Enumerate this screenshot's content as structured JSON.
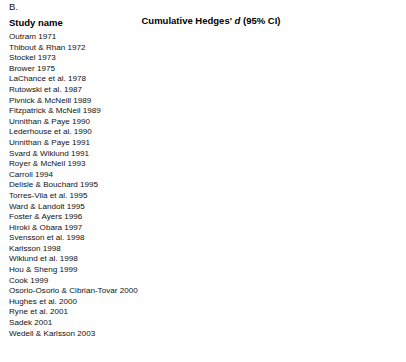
{
  "panel": {
    "label": "B."
  },
  "headers": {
    "study_name": "Study name",
    "effect_prefix": "Cumulative Hedges' ",
    "effect_italic": "d",
    "effect_suffix": " (95% CI)"
  },
  "axis": {
    "ticks": [
      "−1.00",
      "−0.50",
      "0.00",
      "0.50",
      "1.00"
    ],
    "tick_values": [
      -1.0,
      -0.5,
      0.0,
      0.5,
      1.0
    ],
    "min": -1.0,
    "max": 1.0,
    "reference_line": 0.0,
    "gridlines": [
      -1.0,
      0.0,
      1.0
    ]
  },
  "colors": {
    "marker": "#1a1a1a",
    "line": "#333333",
    "gridline": "#888888",
    "reference": "#999999",
    "text": "#111111",
    "background": "#ffffff"
  },
  "chart_data": {
    "type": "forest",
    "title": "Cumulative Hedges' d (95% CI)",
    "xlabel": "",
    "ylabel": "Study name",
    "xlim": [
      -1.0,
      1.0
    ],
    "grid": true,
    "legend": "none",
    "categories": [
      "Outram 1971",
      "Thibout & Rhan 1972",
      "Stockel 1973",
      "Brower 1975",
      "LaChance et al. 1978",
      "Rutowski et al. 1987",
      "Pivnick & McNeill 1989",
      "Fitzpatrick & McNeil 1989",
      "Unnithan & Paye 1990",
      "Lederhouse et al. 1990",
      "Unnithan & Paye 1991",
      "Svard & Wiklund 1991",
      "Royer & McNeil 1993",
      "Carroll 1994",
      "Delisle & Bouchard 1995",
      "Torres-Vila et al. 1995",
      "Ward & Landolt 1995",
      "Foster & Ayers 1996",
      "Hiroki & Obara 1997",
      "Svensson et al. 1998",
      "Karlsson 1998",
      "Wiklund et al. 1998",
      "Hou & Sheng 1999",
      "Cook 1999",
      "Osorio-Osorio & Cibrian-Tovar 2000",
      "Hughes et al. 2000",
      "Ryne et al. 2001",
      "Sadek 2001",
      "Wedell & Karlsson 2003"
    ],
    "points": [
      {
        "study": "Outram 1971",
        "estimate": 0.19,
        "ci_low": -0.45,
        "ci_high": 0.65
      },
      {
        "study": "Thibout & Rhan 1972",
        "estimate": 0.37,
        "ci_low": -0.26,
        "ci_high": 0.98
      },
      {
        "study": "Stockel 1973",
        "estimate": 0.45,
        "ci_low": -0.02,
        "ci_high": 0.88
      },
      {
        "study": "Brower 1975",
        "estimate": 0.38,
        "ci_low": -0.09,
        "ci_high": 0.79
      },
      {
        "study": "LaChance et al. 1978",
        "estimate": 0.48,
        "ci_low": 0.04,
        "ci_high": 0.88
      },
      {
        "study": "Rutowski et al. 1987",
        "estimate": 0.42,
        "ci_low": 0.0,
        "ci_high": 0.81
      },
      {
        "study": "Pivnick & McNeill 1989",
        "estimate": 0.5,
        "ci_low": 0.1,
        "ci_high": 0.88
      },
      {
        "study": "Fitzpatrick & McNeil 1989",
        "estimate": 0.42,
        "ci_low": 0.04,
        "ci_high": 0.78
      },
      {
        "study": "Unnithan & Paye 1990",
        "estimate": 0.28,
        "ci_low": -0.14,
        "ci_high": 0.67
      },
      {
        "study": "Lederhouse et al. 1990",
        "estimate": 0.3,
        "ci_low": -0.08,
        "ci_high": 0.64
      },
      {
        "study": "Unnithan & Paye 1991",
        "estimate": 0.3,
        "ci_low": -0.1,
        "ci_high": 0.62
      },
      {
        "study": "Svard & Wiklund 1991",
        "estimate": 0.22,
        "ci_low": -0.18,
        "ci_high": 0.58
      },
      {
        "study": "Royer & McNeil 1993",
        "estimate": 0.2,
        "ci_low": -0.16,
        "ci_high": 0.54
      },
      {
        "study": "Carroll 1994",
        "estimate": 0.22,
        "ci_low": -0.13,
        "ci_high": 0.54
      },
      {
        "study": "Delisle & Bouchard 1995",
        "estimate": 0.27,
        "ci_low": -0.06,
        "ci_high": 0.56
      },
      {
        "study": "Torres-Vila et al. 1995",
        "estimate": 0.33,
        "ci_low": 0.02,
        "ci_high": 0.66
      },
      {
        "study": "Ward & Landolt 1995",
        "estimate": 0.29,
        "ci_low": -0.02,
        "ci_high": 0.58
      },
      {
        "study": "Foster & Ayers 1996",
        "estimate": 0.3,
        "ci_low": 0.01,
        "ci_high": 0.57
      },
      {
        "study": "Hiroki & Obara 1997",
        "estimate": 0.26,
        "ci_low": -0.02,
        "ci_high": 0.52
      },
      {
        "study": "Svensson et al. 1998",
        "estimate": 0.27,
        "ci_low": 0.01,
        "ci_high": 0.52
      },
      {
        "study": "Karlsson 1998",
        "estimate": 0.27,
        "ci_low": 0.03,
        "ci_high": 0.51
      },
      {
        "study": "Wiklund et al. 1998",
        "estimate": 0.26,
        "ci_low": 0.03,
        "ci_high": 0.5
      },
      {
        "study": "Hou & Sheng 1999",
        "estimate": 0.28,
        "ci_low": 0.06,
        "ci_high": 0.5
      },
      {
        "study": "Cook 1999",
        "estimate": 0.3,
        "ci_low": 0.08,
        "ci_high": 0.51
      },
      {
        "study": "Osorio-Osorio & Cibrian-Tovar 2000",
        "estimate": 0.3,
        "ci_low": 0.09,
        "ci_high": 0.5
      },
      {
        "study": "Hughes et al. 2000",
        "estimate": 0.31,
        "ci_low": 0.11,
        "ci_high": 0.5
      },
      {
        "study": "Ryne et al. 2001",
        "estimate": 0.32,
        "ci_low": 0.13,
        "ci_high": 0.51
      },
      {
        "study": "Sadek 2001",
        "estimate": 0.31,
        "ci_low": 0.13,
        "ci_high": 0.49
      },
      {
        "study": "Wedell & Karlsson 2003",
        "estimate": 0.34,
        "ci_low": 0.17,
        "ci_high": 0.52
      }
    ],
    "summary": {
      "label": "",
      "estimate": 0.34,
      "ci_low": 0.17,
      "ci_high": 0.52,
      "shape": "diamond"
    }
  }
}
